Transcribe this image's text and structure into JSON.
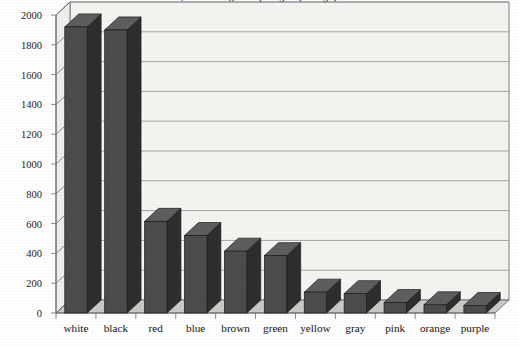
{
  "chart_data": {
    "type": "bar",
    "title": "(title cut off at top edge of image)",
    "subtitle": "",
    "xlabel": "",
    "ylabel": "",
    "ylim": [
      0,
      2000
    ],
    "ytick_step": 200,
    "yticks": [
      0,
      200,
      400,
      600,
      800,
      1000,
      1200,
      1400,
      1600,
      1800,
      2000
    ],
    "ytick_labels": [
      "0",
      "200",
      "400",
      "600",
      "800",
      "1000",
      "1200",
      "1400",
      "1600",
      "1800",
      "2000"
    ],
    "categories": [
      "white",
      "black",
      "red",
      "blue",
      "brown",
      "green",
      "yellow",
      "gray",
      "pink",
      "orange",
      "purple"
    ],
    "values": [
      1920,
      1900,
      615,
      520,
      415,
      385,
      140,
      130,
      70,
      55,
      50
    ],
    "grid": true,
    "grid_axis": "y",
    "legend": null,
    "legend_position": "none",
    "style": "3d-bar",
    "bar_face_color": "#4c4c4c",
    "bar_side_color": "#2e2e2e",
    "bar_top_color": "#5e5e5e",
    "plot_background_color": "#f4f4f1",
    "floor_color": "#c9c9c6",
    "gridline_color": "#9a9a9a",
    "axis_color": "#6f6f6f",
    "text_color": "#141414"
  },
  "axes": {
    "y_label_text": "",
    "x_label_text": ""
  }
}
